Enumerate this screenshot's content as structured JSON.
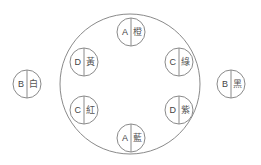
{
  "diagram": {
    "title": "",
    "stroke_color": "#8a8a8a",
    "text_color": "#444444",
    "inner_group": [
      {
        "letter": "A",
        "char": "橙"
      },
      {
        "letter": "C",
        "char": "綠"
      },
      {
        "letter": "D",
        "char": "紫"
      },
      {
        "letter": "A",
        "char": "藍"
      },
      {
        "letter": "C",
        "char": "紅"
      },
      {
        "letter": "D",
        "char": "黃"
      }
    ],
    "outer_left": {
      "letter": "B",
      "char": "白"
    },
    "outer_right": {
      "letter": "B",
      "char": "黑"
    }
  }
}
